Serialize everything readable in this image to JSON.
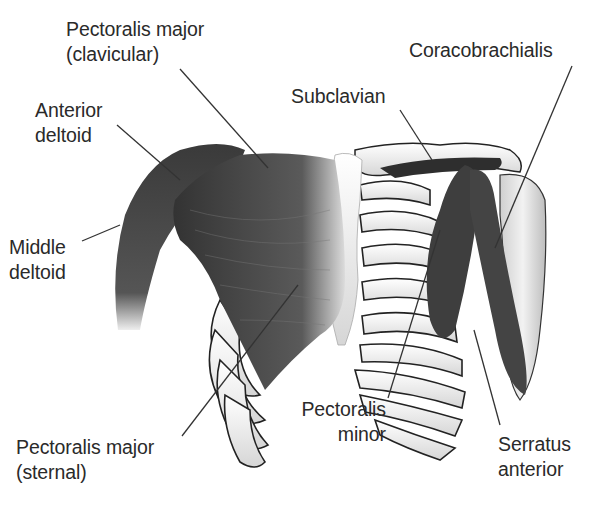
{
  "figure": {
    "labels": {
      "pec_major_clav": {
        "line1": "Pectoralis major",
        "line2": "(clavicular)"
      },
      "anterior_deltoid": {
        "line1": "Anterior",
        "line2": "deltoid"
      },
      "middle_deltoid": {
        "line1": "Middle",
        "line2": "deltoid"
      },
      "subclavian": {
        "line1": "Subclavian"
      },
      "coracobrachialis": {
        "line1": "Coracobrachialis"
      },
      "pec_major_sternal": {
        "line1": "Pectoralis major",
        "line2": "(sternal)"
      },
      "pec_minor": {
        "line1": "Pectoralis",
        "line2": "minor"
      },
      "serratus_anterior": {
        "line1": "Serratus",
        "line2": "anterior"
      }
    }
  }
}
